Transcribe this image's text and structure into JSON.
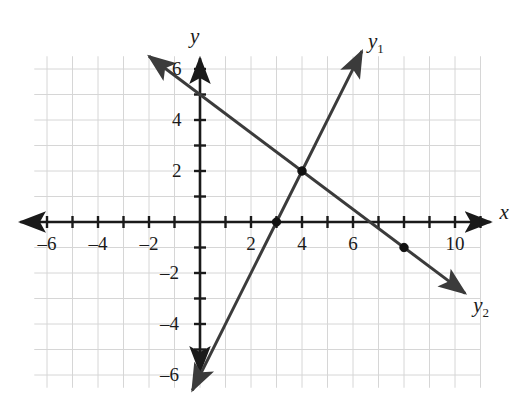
{
  "chart_data": {
    "type": "line",
    "title": "",
    "xlabel": "x",
    "ylabel": "y",
    "xlim": [
      -6.5,
      11
    ],
    "ylim": [
      -6.5,
      6.5
    ],
    "grid": true,
    "grid_step": 1,
    "legend_position": "inline-end-of-line",
    "x_ticks": [
      -6,
      -4,
      -2,
      2,
      4,
      6,
      10
    ],
    "x_tick_labels": [
      "–6",
      "–4",
      "–2",
      "2",
      "4",
      "6",
      "10"
    ],
    "y_ticks": [
      6,
      4,
      2,
      -2,
      -4,
      -6
    ],
    "y_tick_labels": [
      "6",
      "4",
      "2",
      "–2",
      "–4",
      "–6"
    ],
    "series": [
      {
        "name": "y1",
        "label_text": "y",
        "label_sub": "1",
        "slope": 2,
        "intercept": -6,
        "equation": "y = 2x - 6",
        "points": [
          [
            0,
            -6
          ],
          [
            3,
            0
          ],
          [
            4,
            2
          ]
        ],
        "draw_from": [
          -0.3,
          -6.6
        ],
        "draw_to": [
          6.35,
          6.7
        ],
        "arrow_start": true,
        "arrow_end": true,
        "color": "#3b3b3b"
      },
      {
        "name": "y2",
        "label_text": "y",
        "label_sub": "2",
        "slope": -0.75,
        "intercept": 5,
        "equation": "y = -0.75x + 5",
        "points": [
          [
            0,
            5
          ],
          [
            4,
            2
          ],
          [
            8,
            -1
          ]
        ],
        "draw_from": [
          -2.0,
          6.5
        ],
        "draw_to": [
          10.4,
          -2.8
        ],
        "arrow_start": true,
        "arrow_end": true,
        "color": "#3b3b3b"
      }
    ],
    "marked_points": [
      {
        "x": 3,
        "y": 0,
        "label": ""
      },
      {
        "x": 4,
        "y": 2,
        "label": ""
      },
      {
        "x": 8,
        "y": -1,
        "label": ""
      }
    ],
    "colors": {
      "grid": "#d6d6d6",
      "axis": "#1a1a1a",
      "curve": "#3b3b3b",
      "point": "#111111",
      "background": "#ffffff"
    }
  },
  "labels": {
    "x_axis": "x",
    "y_axis": "y",
    "curve_1_base": "y",
    "curve_1_sub": "1",
    "curve_2_base": "y",
    "curve_2_sub": "2"
  }
}
